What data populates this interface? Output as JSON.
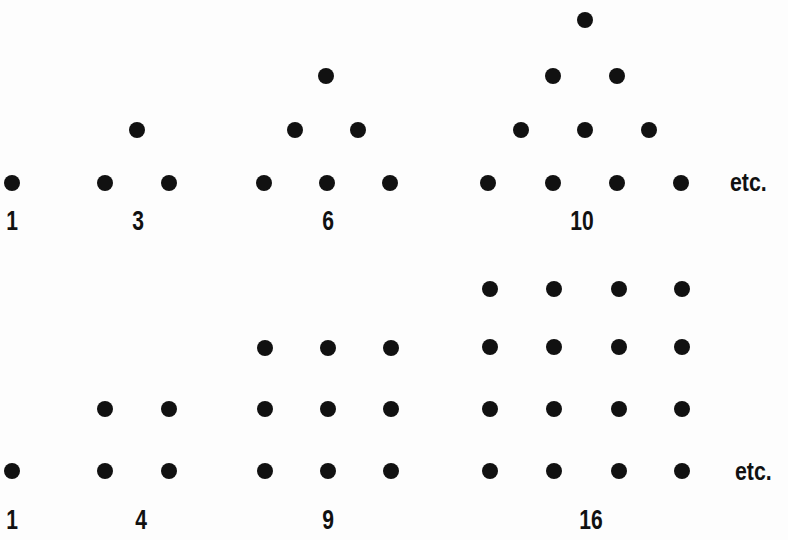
{
  "rows": [
    {
      "name": "triangular-numbers",
      "figures": [
        {
          "label": "1",
          "label_x": 12,
          "dots": [
            [
              12,
              183
            ]
          ]
        },
        {
          "label": "3",
          "label_x": 138,
          "dots": [
            [
              137,
              130
            ],
            [
              105,
              183
            ],
            [
              169,
              183
            ]
          ]
        },
        {
          "label": "6",
          "label_x": 328,
          "dots": [
            [
              326,
              76
            ],
            [
              295,
              130
            ],
            [
              358,
              130
            ],
            [
              264,
              183
            ],
            [
              327,
              183
            ],
            [
              390,
              183
            ]
          ]
        },
        {
          "label": "10",
          "label_x": 582,
          "dots": [
            [
              585,
              20
            ],
            [
              553,
              76
            ],
            [
              617,
              76
            ],
            [
              521,
              130
            ],
            [
              585,
              130
            ],
            [
              649,
              130
            ],
            [
              488,
              183
            ],
            [
              553,
              183
            ],
            [
              617,
              183
            ],
            [
              681,
              183
            ]
          ]
        }
      ],
      "label_y": 208,
      "etc": {
        "text": "etc.",
        "x": 730,
        "y": 169
      }
    },
    {
      "name": "square-numbers",
      "figures": [
        {
          "label": "1",
          "label_x": 12,
          "dots": [
            [
              12,
              471
            ]
          ]
        },
        {
          "label": "4",
          "label_x": 141,
          "dots": [
            [
              105,
              409
            ],
            [
              169,
              409
            ],
            [
              105,
              471
            ],
            [
              169,
              471
            ]
          ]
        },
        {
          "label": "9",
          "label_x": 328,
          "dots": [
            [
              265,
              348
            ],
            [
              328,
              348
            ],
            [
              391,
              348
            ],
            [
              265,
              409
            ],
            [
              328,
              409
            ],
            [
              391,
              409
            ],
            [
              265,
              471
            ],
            [
              328,
              471
            ],
            [
              391,
              471
            ]
          ]
        },
        {
          "label": "16",
          "label_x": 591,
          "dots": [
            [
              490,
              289
            ],
            [
              554,
              289
            ],
            [
              619,
              289
            ],
            [
              682,
              289
            ],
            [
              490,
              347
            ],
            [
              554,
              347
            ],
            [
              619,
              347
            ],
            [
              682,
              347
            ],
            [
              490,
              409
            ],
            [
              554,
              409
            ],
            [
              619,
              409
            ],
            [
              682,
              409
            ],
            [
              490,
              471
            ],
            [
              554,
              471
            ],
            [
              619,
              471
            ],
            [
              682,
              471
            ]
          ]
        }
      ],
      "label_y": 507,
      "etc": {
        "text": "etc.",
        "x": 735,
        "y": 458
      }
    }
  ]
}
